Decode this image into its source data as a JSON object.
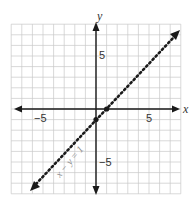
{
  "chart_data": {
    "type": "line",
    "title": "",
    "xlabel": "x",
    "ylabel": "y",
    "xlim": [
      -8,
      8
    ],
    "ylim": [
      -8,
      8
    ],
    "grid": true,
    "x_ticks_labeled": [
      {
        "value": -5,
        "label": "−5"
      },
      {
        "value": 5,
        "label": "5"
      }
    ],
    "y_ticks_labeled": [
      {
        "value": 5,
        "label": "5"
      },
      {
        "value": -5,
        "label": "−5"
      }
    ],
    "series": [
      {
        "name": "x − y = 1",
        "equation": "x - y = 1",
        "style": "dotted",
        "arrows": "both",
        "x": [
          -7.5,
          7.5
        ],
        "y": [
          -8.5,
          6.5
        ]
      }
    ],
    "points": [
      {
        "x": 1,
        "y": 0
      },
      {
        "x": 0,
        "y": -1
      }
    ],
    "annotations": [
      {
        "text": "x − y = 1",
        "x": -4.5,
        "y": -5.5,
        "rotation": -45
      }
    ]
  },
  "labels": {
    "x_axis": "x",
    "y_axis": "y",
    "x_neg5": "−5",
    "x_pos5": "5",
    "y_pos5": "5",
    "y_neg5": "−5",
    "equation": "x − y = 1"
  },
  "colors": {
    "grid": "#c8c8c8",
    "axis": "#1a1a1a",
    "line": "#1a1a1a",
    "label": "#8a8a8a"
  }
}
